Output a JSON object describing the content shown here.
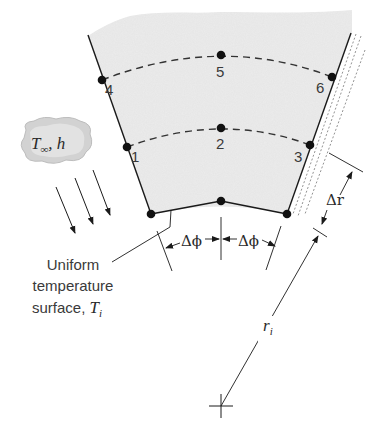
{
  "diagram": {
    "type": "finite-difference nodal network in cylindrical coordinates",
    "colors": {
      "medium_fill": "#ececec",
      "line": "#1a1a1a",
      "node": "#111111",
      "cloud": "#cfcfcf"
    },
    "nodes": [
      {
        "id": "node-4",
        "label": "4"
      },
      {
        "id": "node-5",
        "label": "5"
      },
      {
        "id": "node-6",
        "label": "6"
      },
      {
        "id": "node-1",
        "label": "1"
      },
      {
        "id": "node-2",
        "label": "2"
      },
      {
        "id": "node-3",
        "label": "3"
      }
    ],
    "fluid": {
      "label_T": "T",
      "label_sub": "∞",
      "label_rest": ", h"
    },
    "dimensions": {
      "delta_phi_1": "Δϕ",
      "delta_phi_2": "Δϕ",
      "delta_r": "Δr",
      "radius_main": "r",
      "radius_sub": "i"
    },
    "caption": {
      "line1": "Uniform",
      "line2": "temperature",
      "line3_text": "surface, ",
      "line3_T": "T",
      "line3_sub": "i"
    }
  }
}
